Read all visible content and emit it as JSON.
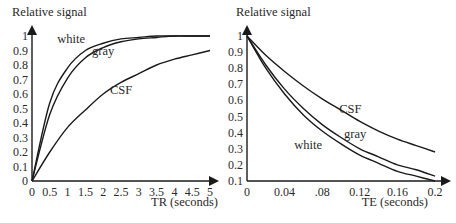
{
  "chart_data": [
    {
      "type": "line",
      "title": "",
      "ylabel": "Relative signal",
      "xlabel": "TR (seconds)",
      "xlim": [
        0,
        5
      ],
      "ylim": [
        0,
        1
      ],
      "x_ticks": [
        "0",
        "0.5",
        "1",
        "1.5",
        "2",
        "2.5",
        "3",
        "3.5",
        "4",
        "4.5",
        "5"
      ],
      "y_ticks": [
        "0",
        "0.1",
        "0.2",
        "0.3",
        "0.4",
        "0.5",
        "0.6",
        "0.7",
        "0.8",
        "0.9",
        "1"
      ],
      "grid": false,
      "legend": "inline labels",
      "x": [
        0,
        0.5,
        1,
        1.5,
        2,
        2.5,
        3,
        3.5,
        4,
        4.5,
        5
      ],
      "series": [
        {
          "name": "white",
          "values": [
            0.0,
            0.54,
            0.78,
            0.9,
            0.95,
            0.98,
            0.99,
            1.0,
            1.0,
            1.0,
            1.0
          ]
        },
        {
          "name": "gray",
          "values": [
            0.0,
            0.46,
            0.71,
            0.85,
            0.92,
            0.96,
            0.98,
            0.99,
            1.0,
            1.0,
            1.0
          ]
        },
        {
          "name": "CSF",
          "values": [
            0.0,
            0.2,
            0.37,
            0.49,
            0.6,
            0.68,
            0.74,
            0.8,
            0.84,
            0.87,
            0.9
          ]
        }
      ],
      "annotations": [
        {
          "text": "white",
          "x": 1.1,
          "y": 0.95
        },
        {
          "text": "gray",
          "x": 2.0,
          "y": 0.87
        },
        {
          "text": "CSF",
          "x": 2.5,
          "y": 0.6
        }
      ]
    },
    {
      "type": "line",
      "title": "",
      "ylabel": "Relative signal",
      "xlabel": "TE (seconds)",
      "xlim": [
        0,
        0.2
      ],
      "ylim": [
        0.1,
        1
      ],
      "x_ticks": [
        "0",
        "0.04",
        ".08",
        "0.12",
        "0.16",
        "0.2"
      ],
      "y_ticks": [
        "0.1",
        "0.2",
        "0.3",
        "0.4",
        "0.5",
        "0.6",
        "0.7",
        "0.8",
        "0.9",
        "1"
      ],
      "grid": false,
      "legend": "inline labels",
      "x": [
        0,
        0.02,
        0.04,
        0.06,
        0.08,
        0.1,
        0.12,
        0.14,
        0.16,
        0.18,
        0.2
      ],
      "series": [
        {
          "name": "CSF",
          "values": [
            1.0,
            0.88,
            0.78,
            0.69,
            0.61,
            0.54,
            0.47,
            0.41,
            0.36,
            0.32,
            0.28
          ]
        },
        {
          "name": "gray",
          "values": [
            1.0,
            0.82,
            0.67,
            0.55,
            0.45,
            0.37,
            0.3,
            0.25,
            0.2,
            0.17,
            0.13
          ]
        },
        {
          "name": "white",
          "values": [
            1.0,
            0.8,
            0.64,
            0.51,
            0.41,
            0.33,
            0.26,
            0.21,
            0.16,
            0.13,
            0.1
          ]
        }
      ],
      "annotations": [
        {
          "text": "CSF",
          "x": 0.11,
          "y": 0.52
        },
        {
          "text": "gray",
          "x": 0.115,
          "y": 0.37
        },
        {
          "text": "white",
          "x": 0.065,
          "y": 0.3
        }
      ]
    }
  ]
}
